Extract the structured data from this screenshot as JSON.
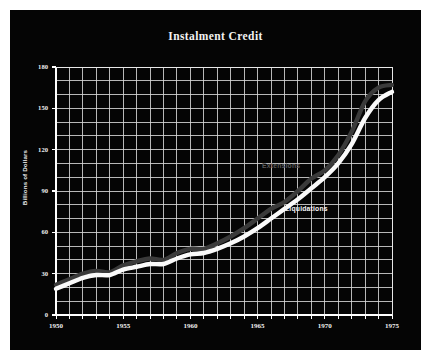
{
  "chart": {
    "title": "Instalment Credit",
    "ylabel": "Billions of Dollars"
  },
  "axes": {
    "y_ticks": [
      "0",
      "30",
      "60",
      "90",
      "120",
      "150",
      "180"
    ],
    "x_ticks": [
      "1950",
      "1955",
      "1960",
      "1965",
      "1970",
      "1975"
    ]
  },
  "annotations": {
    "extensions": "Extensions",
    "liquidations": "Liquidations"
  },
  "chart_data": {
    "type": "line",
    "title": "Instalment Credit",
    "subtitle": "",
    "xlabel": "",
    "ylabel": "Billions of Dollars",
    "xlim": [
      1950,
      1975
    ],
    "ylim": [
      0,
      180
    ],
    "x_ticks": [
      1950,
      1955,
      1960,
      1965,
      1970,
      1975
    ],
    "y_ticks": [
      0,
      30,
      60,
      90,
      120,
      150,
      180
    ],
    "grid": {
      "enabled": true,
      "x_step": 1,
      "y_step": 10,
      "color": "#d8d8d8"
    },
    "background": "#050505",
    "legend": "inline-annotations",
    "x": [
      1950,
      1951,
      1952,
      1953,
      1954,
      1955,
      1956,
      1957,
      1958,
      1959,
      1960,
      1961,
      1962,
      1963,
      1964,
      1965,
      1966,
      1967,
      1968,
      1969,
      1970,
      1971,
      1972,
      1973,
      1974,
      1975
    ],
    "series": [
      {
        "name": "Extensions",
        "color": "#3a3a3a",
        "style": "thick-band",
        "values": [
          22,
          26,
          30,
          32,
          31,
          36,
          39,
          41,
          40,
          45,
          48,
          48,
          52,
          57,
          63,
          70,
          77,
          82,
          90,
          99,
          105,
          116,
          133,
          155,
          165,
          167
        ]
      },
      {
        "name": "Liquidations",
        "color": "#fafafa",
        "style": "thick-band",
        "values": [
          19,
          23,
          27,
          29,
          29,
          33,
          35,
          37,
          37,
          41,
          44,
          45,
          48,
          52,
          57,
          63,
          70,
          77,
          84,
          92,
          100,
          110,
          124,
          143,
          156,
          162
        ]
      }
    ]
  }
}
